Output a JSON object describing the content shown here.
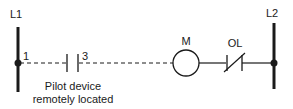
{
  "diagram": {
    "type": "ladder-diagram-rung",
    "rails": {
      "left": {
        "label": "L1"
      },
      "right": {
        "label": "L2"
      }
    },
    "wire_numbers": {
      "left": "1",
      "right": "3"
    },
    "pilot_device": {
      "caption_line1": "Pilot device",
      "caption_line2": "remotely located",
      "symbol": "normally-open-contact",
      "wiring": "dashed"
    },
    "coil": {
      "label": "M",
      "symbol": "circle"
    },
    "overload": {
      "label": "OL",
      "symbol": "normally-closed-contact"
    },
    "colors": {
      "ink": "#1a1a1a",
      "background": "#ffffff"
    }
  }
}
